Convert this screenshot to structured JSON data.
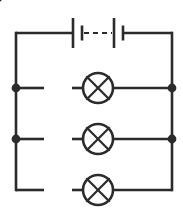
{
  "diagram": {
    "width": 183,
    "height": 218,
    "background_color": "#ffffff",
    "line_color": "#2b2b2b",
    "line_width": 2.6,
    "thin_line_width": 2.2
  },
  "frame": {
    "left_x": 16,
    "right_x": 172,
    "top_y": 33,
    "bottom_y": 190
  },
  "battery": {
    "label": "battery",
    "cells": 2,
    "dashed_gap": true,
    "long_plate_height": 30,
    "short_plate_height": 15,
    "cell1_long_plate_x": 73,
    "cell1_short_plate_x": 82,
    "cell2_long_plate_x": 114,
    "cell2_short_plate_x": 123,
    "dash_start_x": 84,
    "dash_end_x": 112,
    "dash_pattern": "5 4"
  },
  "branches": [
    {
      "name": "branch-one",
      "y": 88,
      "has_left_node": true,
      "has_right_node": true,
      "switch": {
        "name": "switch-one",
        "state": "open",
        "left_wire_end_x": 44,
        "pivot_x": 72,
        "lever_tip_x": 46,
        "lever_tip_y": 76
      },
      "lamp": {
        "name": "lamp-one",
        "center_x": 98,
        "radius": 15
      }
    },
    {
      "name": "branch-two",
      "y": 139,
      "has_left_node": true,
      "has_right_node": true,
      "switch": {
        "name": "switch-two",
        "state": "open",
        "left_wire_end_x": 44,
        "pivot_x": 72,
        "lever_tip_x": 46,
        "lever_tip_y": 127
      },
      "lamp": {
        "name": "lamp-two",
        "center_x": 98,
        "radius": 15
      }
    },
    {
      "name": "branch-three",
      "y": 190,
      "has_left_node": false,
      "has_right_node": false,
      "switch": {
        "name": "switch-three",
        "state": "open",
        "left_wire_end_x": 44,
        "pivot_x": 72,
        "lever_tip_x": 46,
        "lever_tip_y": 178
      },
      "lamp": {
        "name": "lamp-three",
        "center_x": 98,
        "radius": 15
      }
    }
  ],
  "nodes": [
    {
      "name": "node-left-branch-one",
      "x": 16,
      "y": 88,
      "radius": 4.4
    },
    {
      "name": "node-right-branch-one",
      "x": 172,
      "y": 88,
      "radius": 4.4
    },
    {
      "name": "node-left-branch-two",
      "x": 16,
      "y": 139,
      "radius": 4.4
    },
    {
      "name": "node-right-branch-two",
      "x": 172,
      "y": 139,
      "radius": 4.4
    }
  ]
}
